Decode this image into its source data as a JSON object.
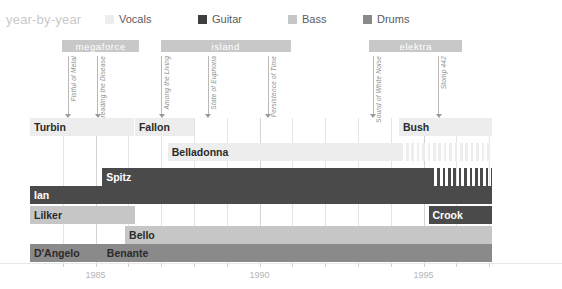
{
  "title": "year-by-year",
  "legend": {
    "items": [
      {
        "label": "Vocals",
        "color": "#ededed",
        "x": 0
      },
      {
        "label": "Guitar",
        "color": "#3f3f3f",
        "x": 93
      },
      {
        "label": "Bass",
        "color": "#c6c6c6",
        "x": 183
      },
      {
        "label": "Drums",
        "color": "#8a8a8a",
        "x": 258
      }
    ]
  },
  "axis": {
    "x_min": 1983.0,
    "x_max": 1997.1,
    "px_per_year": 32.8,
    "ticks_major": [
      1985,
      1990,
      1995
    ],
    "tick_labels": [
      "1985",
      "1990",
      "1995"
    ],
    "ticks_minor": [
      1984,
      1986,
      1987,
      1988,
      1989,
      1991,
      1992,
      1993,
      1994,
      1996,
      1997
    ]
  },
  "record_labels": [
    {
      "name": "megaforce",
      "start": 1983.98,
      "end": 1986.33
    },
    {
      "name": "island",
      "start": 1986.98,
      "end": 1990.95
    },
    {
      "name": "elektra",
      "start": 1993.35,
      "end": 1996.18
    }
  ],
  "albums": [
    {
      "name": "Fistful of Metal",
      "year": 1984.15
    },
    {
      "name": "Spreading the Disease",
      "year": 1985.05
    },
    {
      "name": "Among the Living",
      "year": 1987.0
    },
    {
      "name": "State of Euphoria",
      "year": 1988.42
    },
    {
      "name": "Persistence of Time",
      "year": 1990.25
    },
    {
      "name": "Sound of White Noise",
      "year": 1993.45
    },
    {
      "name": "Stomp 442",
      "year": 1995.45
    }
  ],
  "chart_data": {
    "type": "bar",
    "orientation": "horizontal-timeline",
    "title": "year-by-year",
    "xlabel": "",
    "ylabel": "",
    "xlim": [
      1983.0,
      1997.1
    ],
    "grid": true,
    "legend_position": "top",
    "series": [
      {
        "name": "Vocals",
        "color": "#ededed"
      },
      {
        "name": "Guitar",
        "color": "#3f3f3f"
      },
      {
        "name": "Bass",
        "color": "#c6c6c6"
      },
      {
        "name": "Drums",
        "color": "#8a8a8a"
      }
    ],
    "rows": [
      {
        "row": 0,
        "bars": [
          {
            "label": "Turbin",
            "role": "Vocals",
            "start": 1983.0,
            "end": 1986.17,
            "color": "#ededed",
            "text": "dark",
            "hatched": false
          },
          {
            "label": "Fallon",
            "role": "Vocals",
            "start": 1986.2,
            "end": 1988.0,
            "color": "#ededed",
            "text": "dark",
            "hatched": false
          },
          {
            "label": "Bush",
            "role": "Vocals",
            "start": 1994.25,
            "end": 1997.1,
            "color": "#ededed",
            "text": "dark",
            "hatched": false
          }
        ]
      },
      {
        "row": 1,
        "bars": [
          {
            "label": "Belladonna",
            "role": "Vocals",
            "start": 1987.2,
            "end": 1994.3,
            "color": "#ededed",
            "text": "dark",
            "hatched": false
          },
          {
            "label": "",
            "role": "Vocals",
            "start": 1994.3,
            "end": 1997.1,
            "color": "#ededed",
            "text": "dark",
            "hatched": true
          }
        ]
      },
      {
        "row": 2,
        "bars": [
          {
            "label": "Spitz",
            "role": "Guitar",
            "start": 1985.2,
            "end": 1995.25,
            "color": "#4a4a4a",
            "text": "light",
            "hatched": false
          },
          {
            "label": "",
            "role": "Guitar",
            "start": 1995.25,
            "end": 1997.1,
            "color": "#4a4a4a",
            "text": "light",
            "hatched": true
          }
        ]
      },
      {
        "row": 3,
        "bars": [
          {
            "label": "Ian",
            "role": "Guitar",
            "start": 1983.0,
            "end": 1997.1,
            "color": "#4a4a4a",
            "text": "light",
            "hatched": false
          }
        ]
      },
      {
        "row": 4,
        "bars": [
          {
            "label": "Lilker",
            "role": "Bass",
            "start": 1983.0,
            "end": 1986.2,
            "color": "#c6c6c6",
            "text": "dark",
            "hatched": false
          },
          {
            "label": "Crook",
            "role": "Guitar",
            "start": 1995.15,
            "end": 1997.1,
            "color": "#4a4a4a",
            "text": "light",
            "hatched": false
          }
        ]
      },
      {
        "row": 5,
        "bars": [
          {
            "label": "Bello",
            "role": "Bass",
            "start": 1985.9,
            "end": 1997.1,
            "color": "#c6c6c6",
            "text": "dark",
            "hatched": false
          }
        ]
      },
      {
        "row": 6,
        "bars": [
          {
            "label": "D'Angelo",
            "role": "Drums",
            "start": 1983.0,
            "end": 1985.22,
            "color": "#8a8a8a",
            "text": "dark",
            "hatched": false
          },
          {
            "label": "Benante",
            "role": "Drums",
            "start": 1985.22,
            "end": 1997.1,
            "color": "#8a8a8a",
            "text": "dark",
            "hatched": false
          }
        ]
      }
    ]
  }
}
